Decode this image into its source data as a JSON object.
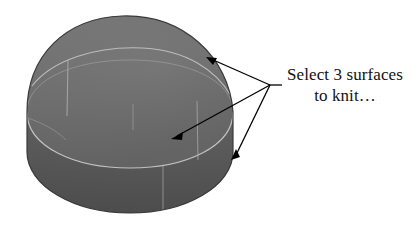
{
  "figure": {
    "type": "3d-cad-solid-callout",
    "background_color": "#ffffff",
    "solid": {
      "name": "rounded-dome-solid",
      "fill_top_color": "#6c6c6c",
      "fill_body_color": "#676767",
      "fill_skirt_color": "#555555",
      "silhouette_color": "#3a3a3a",
      "seam_line_color": "#b9b9b9",
      "surfaces_count": 3,
      "surface_labels": [
        "top-dome-surface",
        "side-band-surface",
        "lower-skirt-surface"
      ]
    },
    "annotation": {
      "name": "knit-surfaces-callout",
      "text_line_1": "Select 3 surfaces",
      "text_line_2": "to knit…",
      "text_color": "#111111",
      "leader_color": "#000000",
      "leader_hub_x": 270,
      "leader_hub_y": 85,
      "arrow_targets": [
        {
          "label": "arrow-to-top-surface",
          "x": 207,
          "y": 57
        },
        {
          "label": "arrow-to-side-surface",
          "x": 172,
          "y": 139
        },
        {
          "label": "arrow-to-skirt-surface",
          "x": 232,
          "y": 159
        }
      ]
    }
  }
}
